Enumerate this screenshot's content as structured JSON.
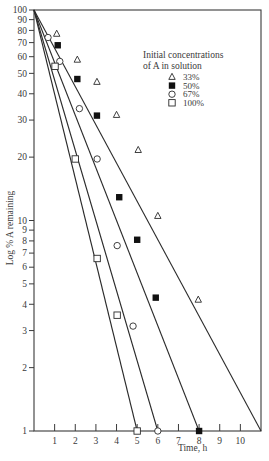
{
  "chart_data": {
    "type": "line",
    "title": "",
    "xlabel": "Time, h",
    "ylabel": "Log % A remaining",
    "yscale": "log",
    "xlim": [
      0,
      11
    ],
    "ylim": [
      1,
      100
    ],
    "grid": false,
    "x_ticks": [
      1,
      2,
      3,
      4,
      5,
      6,
      7,
      8,
      9,
      10
    ],
    "y_ticks": [
      1,
      2,
      3,
      4,
      5,
      6,
      7,
      8,
      9,
      10,
      20,
      30,
      40,
      50,
      60,
      70,
      80,
      90,
      100
    ],
    "legend": {
      "title_line1": "Initial concentrations",
      "title_line2": "of A in solution",
      "position": "upper right"
    },
    "series": [
      {
        "name": "33%",
        "marker": "open-triangle",
        "points": [
          [
            1.1,
            77
          ],
          [
            2.1,
            58
          ],
          [
            3.05,
            45.5
          ],
          [
            4.0,
            31.7
          ],
          [
            5.05,
            21.6
          ],
          [
            6.0,
            10.5
          ],
          [
            7.96,
            4.2
          ]
        ],
        "fit_line": [
          [
            0,
            100
          ],
          [
            11,
            1
          ]
        ]
      },
      {
        "name": "50%",
        "marker": "filled-square",
        "points": [
          [
            1.15,
            68
          ],
          [
            2.1,
            47
          ],
          [
            3.05,
            31.5
          ],
          [
            4.13,
            12.9
          ],
          [
            5.0,
            8.1
          ],
          [
            5.9,
            4.3
          ],
          [
            8.0,
            1.0
          ]
        ],
        "fit_line": [
          [
            0,
            100
          ],
          [
            8,
            1
          ]
        ]
      },
      {
        "name": "67%",
        "marker": "open-circle",
        "points": [
          [
            0.68,
            74
          ],
          [
            1.25,
            57
          ],
          [
            2.2,
            34
          ],
          [
            3.06,
            19.6
          ],
          [
            4.03,
            7.6
          ],
          [
            4.8,
            3.15
          ],
          [
            6.0,
            1.0
          ]
        ],
        "fit_line": [
          [
            0,
            100
          ],
          [
            6,
            1
          ]
        ]
      },
      {
        "name": "100%",
        "marker": "open-square",
        "points": [
          [
            1.02,
            54
          ],
          [
            2.0,
            19.6
          ],
          [
            3.06,
            6.6
          ],
          [
            4.03,
            3.55
          ],
          [
            5.0,
            1.0
          ]
        ],
        "fit_line": [
          [
            0,
            100
          ],
          [
            5,
            1
          ]
        ]
      }
    ]
  }
}
